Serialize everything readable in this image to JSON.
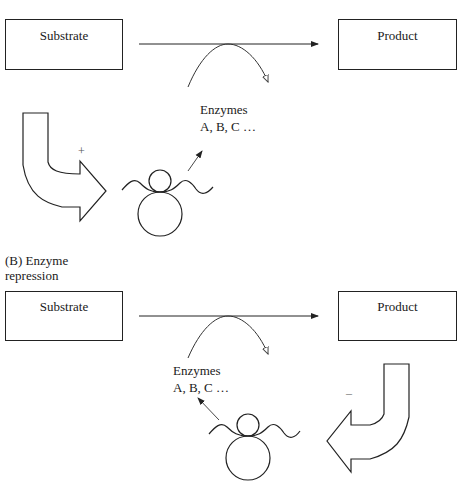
{
  "panel_a": {
    "substrate_label": "Substrate",
    "product_label": "Product",
    "enzymes_line1": "Enzymes",
    "enzymes_line2": "A, B, C …",
    "regulation_sign": "+"
  },
  "panel_b": {
    "title_line1": "(B) Enzyme",
    "title_line2": "repression",
    "substrate_label": "Substrate",
    "product_label": "Product",
    "enzymes_line1": "Enzymes",
    "enzymes_line2": "A, B, C …",
    "regulation_sign": "–"
  },
  "colors": {
    "line": "#222222",
    "background": "#ffffff"
  }
}
